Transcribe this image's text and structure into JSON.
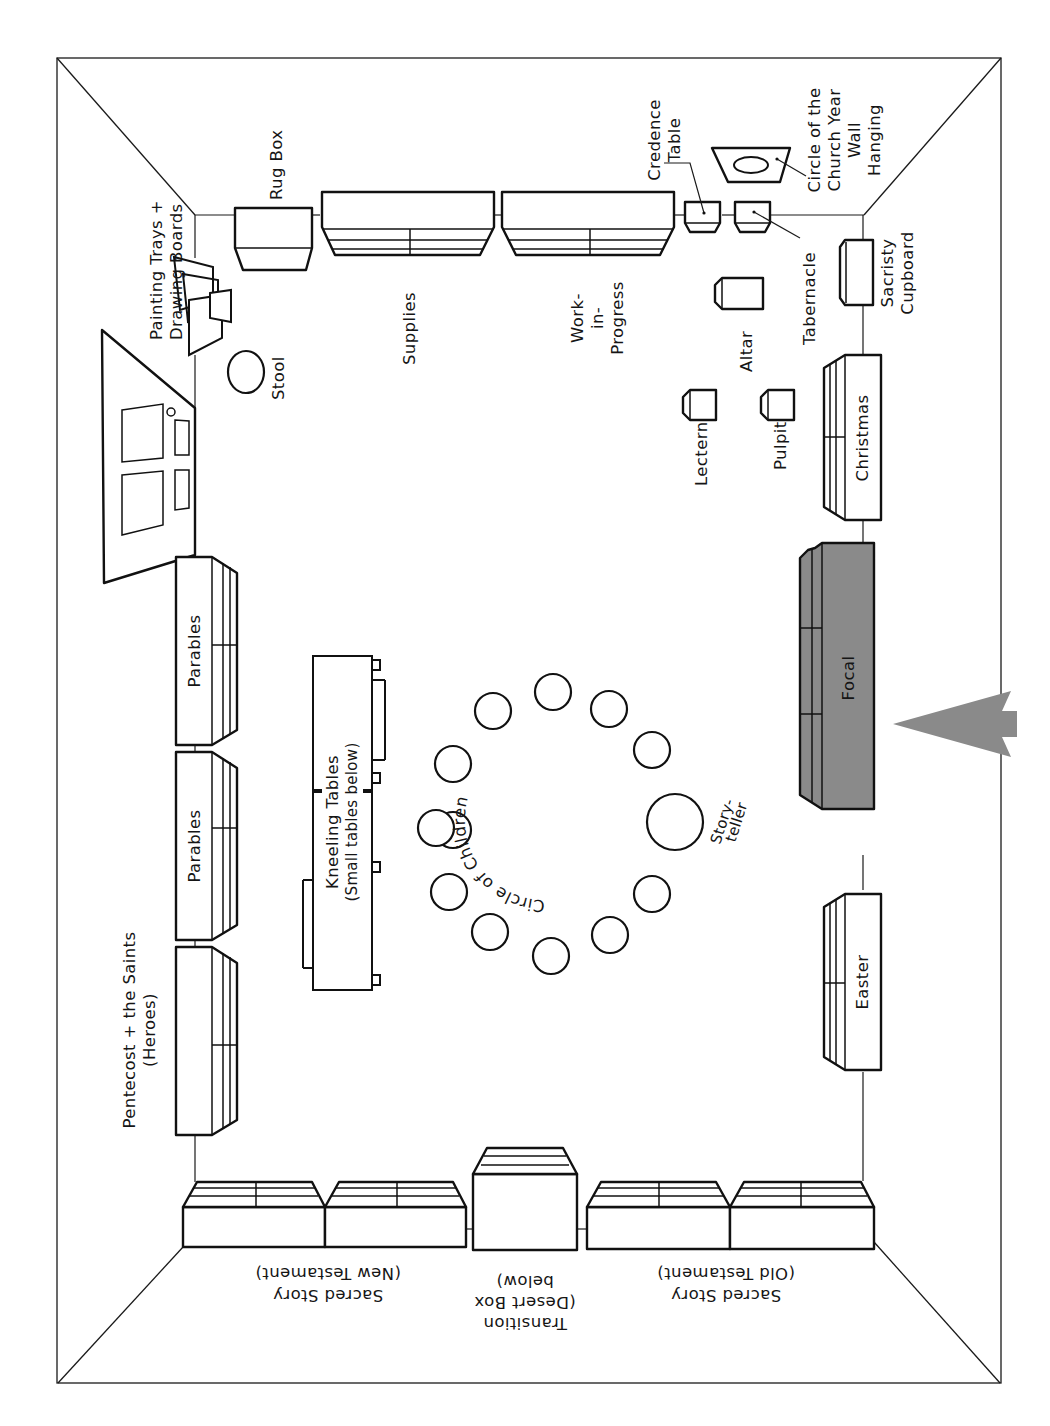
{
  "diagram": {
    "type": "classroom-floor-plan",
    "orientation": "rotated-90-clockwise"
  },
  "labels": {
    "rug_box": "Rug Box",
    "painting_trays_1": "Painting Trays +",
    "painting_trays_2": "Drawing Boards",
    "stool": "Stool",
    "supplies": "Supplies",
    "work_1": "Work-",
    "work_2": "in-",
    "work_3": "Progress",
    "credence_1": "Credence",
    "credence_2": "Table",
    "wall_hanging_1": "Circle of the",
    "wall_hanging_2": "Church Year",
    "wall_hanging_3": "Wall",
    "wall_hanging_4": "Hanging",
    "tabernacle": "Tabernacle",
    "sacristy_1": "Sacristy",
    "sacristy_2": "Cupboard",
    "altar": "Altar",
    "lectern": "Lectern",
    "pulpit": "Pulpit",
    "christmas": "Christmas",
    "focal": "Focal",
    "easter": "Easter",
    "parables_a": "Parables",
    "parables_b": "Parables",
    "pentecost_1": "Pentecost + the Saints",
    "pentecost_2": "(Heroes)",
    "kneeling_1": "Kneeling Tables",
    "kneeling_2": "(Small tables below)",
    "circle_children": "Circle of Children",
    "storyteller_1": "Story-",
    "storyteller_2": "teller",
    "sacred_nt_1": "Sacred Story",
    "sacred_nt_2": "(New Testament)",
    "transition_1": "Transition",
    "transition_2": "(Desert Box",
    "transition_3": "below)",
    "sacred_ot_1": "Sacred Story",
    "sacred_ot_2": "(Old Testament)"
  },
  "colors": {
    "line": "#111111",
    "focal_fill": "#8a8a8a",
    "arrow_fill": "#8a8a8a",
    "background": "#ffffff"
  },
  "children_seats_count": 11
}
